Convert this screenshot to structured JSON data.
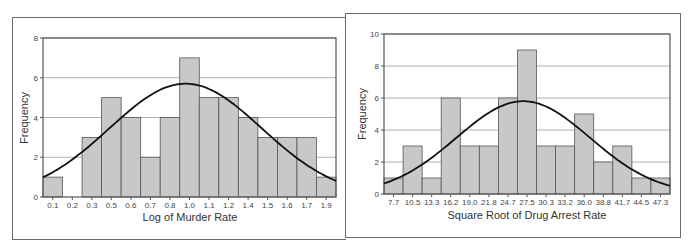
{
  "chart_data": [
    {
      "type": "bar",
      "subtype": "histogram-with-normal-curve",
      "title": "",
      "xlabel": "Log of Murder Rate",
      "ylabel": "Frequency",
      "categories": [
        "0.1",
        "0.2",
        "0.3",
        "0.5",
        "0.6",
        "0.7",
        "0.8",
        "1.0",
        "1.1",
        "1.2",
        "1.4",
        "1.5",
        "1.6",
        "1.7",
        "1.9"
      ],
      "values": [
        1,
        0,
        3,
        5,
        4,
        2,
        4,
        7,
        5,
        5,
        4,
        3,
        3,
        3,
        1
      ],
      "ylim": [
        0,
        8
      ],
      "yticks": [
        0,
        2,
        4,
        6,
        8
      ],
      "grid": true,
      "normal_curve": {
        "peak": 5.7,
        "peak_bin_index": 7.3,
        "sd_bins": 3.9
      },
      "colors": {
        "bar": "#c8c8c8",
        "bar_edge": "#555555",
        "curve": "#111111",
        "grid": "#b0b0b0"
      }
    },
    {
      "type": "bar",
      "subtype": "histogram-with-normal-curve",
      "title": "",
      "xlabel": "Square Root of Drug Arrest Rate",
      "ylabel": "Frequency",
      "categories": [
        "7.7",
        "10.5",
        "13.3",
        "16.2",
        "19.0",
        "21.8",
        "24.7",
        "27.5",
        "30.3",
        "33.2",
        "36.0",
        "38.8",
        "41.7",
        "44.5",
        "47.3"
      ],
      "values": [
        1,
        3,
        1,
        6,
        3,
        3,
        6,
        9,
        3,
        3,
        5,
        2,
        3,
        1,
        1
      ],
      "ylim": [
        0,
        10
      ],
      "yticks": [
        0,
        2,
        4,
        6,
        8,
        10
      ],
      "grid": true,
      "normal_curve": {
        "peak": 5.8,
        "peak_bin_index": 7.3,
        "sd_bins": 3.5
      },
      "colors": {
        "bar": "#c8c8c8",
        "bar_edge": "#555555",
        "curve": "#111111",
        "grid": "#b0b0b0"
      }
    }
  ]
}
